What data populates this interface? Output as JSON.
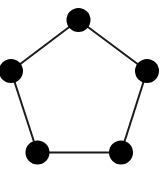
{
  "diagram": {
    "type": "graph",
    "colors": {
      "node": "#000000",
      "edge": "#1a1a1a",
      "background": "#ffffff"
    },
    "node_radius": 12,
    "edge_width": 2,
    "nodes": [
      {
        "id": "top",
        "x": 78.5,
        "y": 20
      },
      {
        "id": "right",
        "x": 147,
        "y": 71
      },
      {
        "id": "bottom-right",
        "x": 121,
        "y": 152.5
      },
      {
        "id": "bottom-left",
        "x": 37.5,
        "y": 152.5
      },
      {
        "id": "left",
        "x": 11,
        "y": 71
      }
    ],
    "edges": [
      [
        "top",
        "right"
      ],
      [
        "right",
        "bottom-right"
      ],
      [
        "bottom-right",
        "bottom-left"
      ],
      [
        "bottom-left",
        "left"
      ],
      [
        "left",
        "top"
      ]
    ]
  }
}
